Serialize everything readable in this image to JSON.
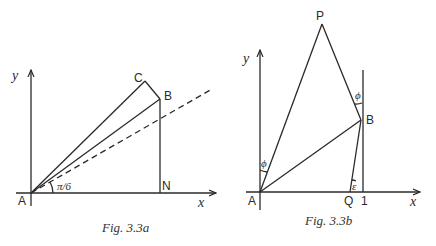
{
  "figures": [
    {
      "id": "fig-3-3a",
      "caption": "Fig.  3.3a",
      "axis_labels": {
        "x": "x",
        "y": "y"
      },
      "points": {
        "A": "A",
        "B": "B",
        "C": "C",
        "N": "N"
      },
      "angle_label": "π/6"
    },
    {
      "id": "fig-3-3b",
      "caption": "Fig.  3.3b",
      "axis_labels": {
        "x": "x",
        "y": "y"
      },
      "points": {
        "A": "A",
        "B": "B",
        "P": "P",
        "Q": "Q"
      },
      "tick_label": "1",
      "angle_labels": {
        "phi_top": "ϕ",
        "phi_left": "ϕ",
        "epsilon": "ε"
      }
    }
  ]
}
